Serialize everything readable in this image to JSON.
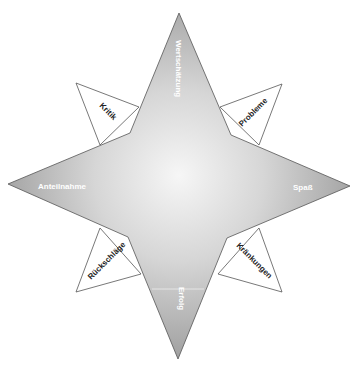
{
  "diagram": {
    "type": "compass-star",
    "main_points": {
      "top": "Wertschätzung",
      "right": "Spaß",
      "bottom": "Erfolg",
      "left": "Anteilnahme"
    },
    "minor_points": {
      "top_left": "Kritik",
      "top_right": "Probleme",
      "bottom_right": "Kränkungen",
      "bottom_left": "Rückschläge"
    },
    "colors": {
      "star_light": "#f4f4f4",
      "star_dark": "#9a9a9a",
      "outline": "#555555",
      "minor_fill": "#ffffff"
    }
  }
}
